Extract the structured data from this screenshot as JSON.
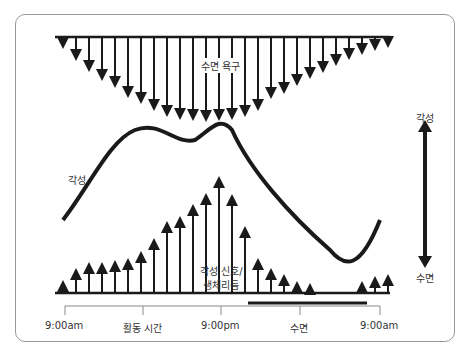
{
  "labels": {
    "sleep_drive": "수면 욕구",
    "wake_curve": "각성",
    "alert_signal_line1": "각성 신호/",
    "alert_signal_line2": "생체리듬",
    "axis_top": "각성",
    "axis_bottom": "수면"
  },
  "timeline": {
    "ticks": [
      "9:00am",
      "활동 시간",
      "9:00pm",
      "수면",
      "9:00am"
    ]
  },
  "colors": {
    "ink": "#1a1a1a",
    "frame": "#999999",
    "text": "#333333"
  }
}
